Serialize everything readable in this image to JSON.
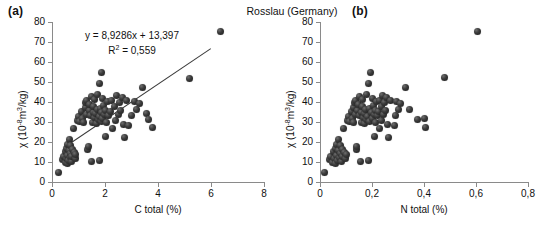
{
  "figure": {
    "title": "Rosslau (Germany)",
    "panel_a_tag": "(a)",
    "panel_b_tag": "(b)"
  },
  "chart_data": [
    {
      "type": "scatter",
      "panel": "(a)",
      "title": "Rosslau (Germany)",
      "xlabel": "C total (%)",
      "ylabel": "χ (10⁻⁸m³/kg)",
      "xlim": [
        0,
        8
      ],
      "ylim": [
        0,
        80
      ],
      "xticks": [
        0,
        2,
        4,
        6,
        8
      ],
      "xticklabels": [
        "0",
        "2",
        "4",
        "6",
        "8"
      ],
      "yticks": [
        0,
        10,
        20,
        30,
        40,
        50,
        60,
        70,
        80
      ],
      "yticklabels": [
        "0",
        "10",
        "20",
        "30",
        "40",
        "50",
        "60",
        "70",
        "80"
      ],
      "grid": false,
      "legend": "none",
      "annotation_line1": "y = 8,9286x + 13,397",
      "annotation_line2": "R² = 0,559",
      "regression": {
        "slope": 8.9286,
        "intercept": 13.397,
        "r2": 0.559,
        "x_start": 0.45,
        "x_end": 6.0
      },
      "marker_color": "#2b2b2b",
      "points": [
        [
          0.25,
          5.0
        ],
        [
          0.4,
          11.5
        ],
        [
          0.45,
          13.0
        ],
        [
          0.5,
          10.0
        ],
        [
          0.52,
          15.5
        ],
        [
          0.55,
          12.0
        ],
        [
          0.55,
          17.0
        ],
        [
          0.58,
          9.5
        ],
        [
          0.6,
          13.5
        ],
        [
          0.6,
          19.0
        ],
        [
          0.62,
          11.0
        ],
        [
          0.65,
          16.0
        ],
        [
          0.65,
          21.5
        ],
        [
          0.68,
          12.5
        ],
        [
          0.7,
          14.5
        ],
        [
          0.7,
          18.5
        ],
        [
          0.72,
          10.5
        ],
        [
          0.75,
          13.0
        ],
        [
          0.78,
          16.5
        ],
        [
          0.8,
          27.0
        ],
        [
          0.85,
          15.0
        ],
        [
          0.88,
          12.0
        ],
        [
          0.9,
          14.0
        ],
        [
          0.95,
          31.0
        ],
        [
          1.0,
          33.0
        ],
        [
          1.05,
          30.5
        ],
        [
          1.1,
          35.5
        ],
        [
          1.15,
          32.0
        ],
        [
          1.2,
          30.0
        ],
        [
          1.25,
          37.5
        ],
        [
          1.28,
          40.0
        ],
        [
          1.3,
          34.0
        ],
        [
          1.32,
          41.0
        ],
        [
          1.35,
          16.5
        ],
        [
          1.38,
          18.0
        ],
        [
          1.4,
          36.0
        ],
        [
          1.42,
          39.0
        ],
        [
          1.45,
          33.5
        ],
        [
          1.48,
          43.0
        ],
        [
          1.5,
          10.5
        ],
        [
          1.52,
          30.0
        ],
        [
          1.55,
          35.0
        ],
        [
          1.58,
          38.0
        ],
        [
          1.6,
          41.5
        ],
        [
          1.62,
          32.5
        ],
        [
          1.65,
          34.5
        ],
        [
          1.68,
          29.5
        ],
        [
          1.7,
          36.5
        ],
        [
          1.72,
          44.0
        ],
        [
          1.75,
          31.5
        ],
        [
          1.78,
          33.0
        ],
        [
          1.8,
          10.8
        ],
        [
          1.8,
          49.5
        ],
        [
          1.82,
          37.0
        ],
        [
          1.85,
          30.5
        ],
        [
          1.85,
          55.0
        ],
        [
          1.88,
          35.0
        ],
        [
          1.9,
          42.0
        ],
        [
          1.92,
          32.0
        ],
        [
          1.95,
          38.5
        ],
        [
          1.98,
          34.0
        ],
        [
          2.0,
          23.0
        ],
        [
          2.02,
          36.0
        ],
        [
          2.05,
          30.0
        ],
        [
          2.1,
          40.5
        ],
        [
          2.15,
          33.5
        ],
        [
          2.2,
          35.5
        ],
        [
          2.25,
          41.0
        ],
        [
          2.3,
          27.0
        ],
        [
          2.35,
          38.0
        ],
        [
          2.4,
          31.0
        ],
        [
          2.45,
          43.5
        ],
        [
          2.5,
          34.0
        ],
        [
          2.55,
          40.0
        ],
        [
          2.6,
          36.0
        ],
        [
          2.65,
          42.5
        ],
        [
          2.7,
          29.0
        ],
        [
          2.75,
          22.5
        ],
        [
          2.8,
          41.0
        ],
        [
          2.9,
          28.5
        ],
        [
          3.0,
          33.5
        ],
        [
          3.1,
          40.5
        ],
        [
          3.2,
          36.5
        ],
        [
          3.3,
          39.5
        ],
        [
          3.4,
          47.5
        ],
        [
          3.55,
          34.5
        ],
        [
          3.65,
          31.5
        ],
        [
          3.8,
          27.5
        ],
        [
          5.2,
          52.0
        ],
        [
          6.35,
          75.5
        ]
      ]
    },
    {
      "type": "scatter",
      "panel": "(b)",
      "title": "Rosslau (Germany)",
      "xlabel": "N total (%)",
      "ylabel": "χ (10⁻⁸m³/kg)",
      "xlim": [
        0,
        0.8
      ],
      "ylim": [
        0,
        80
      ],
      "xticks": [
        0,
        0.2,
        0.4,
        0.6,
        0.8
      ],
      "xticklabels": [
        "0",
        "0,2",
        "0,4",
        "0,6",
        "0,8"
      ],
      "yticks": [
        0,
        10,
        20,
        30,
        40,
        50,
        60,
        70,
        80
      ],
      "yticklabels": [
        "0",
        "10",
        "20",
        "30",
        "40",
        "50",
        "60",
        "70",
        "80"
      ],
      "grid": false,
      "legend": "none",
      "regression": null,
      "marker_color": "#2b2b2b",
      "points": [
        [
          0.018,
          5.0
        ],
        [
          0.035,
          11.5
        ],
        [
          0.04,
          13.0
        ],
        [
          0.048,
          10.0
        ],
        [
          0.05,
          15.5
        ],
        [
          0.055,
          12.0
        ],
        [
          0.058,
          17.0
        ],
        [
          0.06,
          9.5
        ],
        [
          0.062,
          13.5
        ],
        [
          0.065,
          19.0
        ],
        [
          0.068,
          11.0
        ],
        [
          0.07,
          16.0
        ],
        [
          0.072,
          21.5
        ],
        [
          0.075,
          12.5
        ],
        [
          0.078,
          14.5
        ],
        [
          0.08,
          18.5
        ],
        [
          0.082,
          10.5
        ],
        [
          0.085,
          13.0
        ],
        [
          0.088,
          16.5
        ],
        [
          0.09,
          27.0
        ],
        [
          0.095,
          15.0
        ],
        [
          0.098,
          12.0
        ],
        [
          0.1,
          14.0
        ],
        [
          0.105,
          31.0
        ],
        [
          0.11,
          33.0
        ],
        [
          0.115,
          30.5
        ],
        [
          0.12,
          35.5
        ],
        [
          0.125,
          32.0
        ],
        [
          0.128,
          30.0
        ],
        [
          0.13,
          37.5
        ],
        [
          0.132,
          40.0
        ],
        [
          0.135,
          34.0
        ],
        [
          0.138,
          41.0
        ],
        [
          0.14,
          16.5
        ],
        [
          0.142,
          18.0
        ],
        [
          0.145,
          36.0
        ],
        [
          0.148,
          39.0
        ],
        [
          0.15,
          33.5
        ],
        [
          0.152,
          43.0
        ],
        [
          0.155,
          10.5
        ],
        [
          0.158,
          30.0
        ],
        [
          0.16,
          35.0
        ],
        [
          0.162,
          38.0
        ],
        [
          0.165,
          41.5
        ],
        [
          0.168,
          32.5
        ],
        [
          0.17,
          34.5
        ],
        [
          0.172,
          29.5
        ],
        [
          0.175,
          36.5
        ],
        [
          0.178,
          44.0
        ],
        [
          0.18,
          31.5
        ],
        [
          0.182,
          33.0
        ],
        [
          0.185,
          10.8
        ],
        [
          0.188,
          49.5
        ],
        [
          0.19,
          37.0
        ],
        [
          0.192,
          30.5
        ],
        [
          0.195,
          55.0
        ],
        [
          0.198,
          35.0
        ],
        [
          0.2,
          42.0
        ],
        [
          0.202,
          32.0
        ],
        [
          0.205,
          38.5
        ],
        [
          0.208,
          34.0
        ],
        [
          0.21,
          23.0
        ],
        [
          0.212,
          36.0
        ],
        [
          0.215,
          30.0
        ],
        [
          0.218,
          40.5
        ],
        [
          0.22,
          33.5
        ],
        [
          0.225,
          35.5
        ],
        [
          0.228,
          41.0
        ],
        [
          0.23,
          27.0
        ],
        [
          0.235,
          38.0
        ],
        [
          0.238,
          31.0
        ],
        [
          0.24,
          43.5
        ],
        [
          0.245,
          34.0
        ],
        [
          0.248,
          40.0
        ],
        [
          0.25,
          36.0
        ],
        [
          0.255,
          42.5
        ],
        [
          0.258,
          29.0
        ],
        [
          0.262,
          22.5
        ],
        [
          0.27,
          41.0
        ],
        [
          0.285,
          28.5
        ],
        [
          0.29,
          33.5
        ],
        [
          0.295,
          40.5
        ],
        [
          0.3,
          36.5
        ],
        [
          0.31,
          39.5
        ],
        [
          0.33,
          47.5
        ],
        [
          0.345,
          36.5
        ],
        [
          0.375,
          31.5
        ],
        [
          0.4,
          32.0
        ],
        [
          0.405,
          27.5
        ],
        [
          0.48,
          52.5
        ],
        [
          0.605,
          75.5
        ]
      ]
    }
  ]
}
